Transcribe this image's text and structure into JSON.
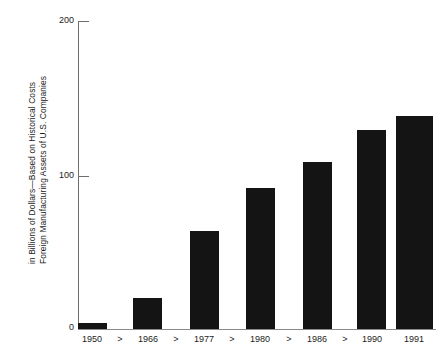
{
  "chart_data": {
    "type": "bar",
    "title": "",
    "subtitle": "",
    "xlabel": "",
    "ylabel_lines": [
      "Foreign Manufacturing Assets of U.S. Companies",
      "in Billions of Dollars—Based on Historical Costs"
    ],
    "ylabel": "Foreign Manufacturing Assets of U.S. Companies in Billions of Dollars—Based on Historical Costs",
    "categories": [
      "1950",
      "1966",
      "1977",
      "1980",
      "1986",
      "1990",
      "1991"
    ],
    "values": [
      4,
      20,
      64,
      92,
      109,
      130,
      139
    ],
    "ylim": [
      0,
      200
    ],
    "yticks": [
      "0",
      "100",
      "200"
    ],
    "ytick_values": [
      0,
      100,
      200
    ],
    "grid": false,
    "legend": "none",
    "axis_break_marker": ">",
    "axis_break_positions": [
      0,
      1,
      2,
      3,
      4
    ],
    "bar_color": "#141414",
    "axis_color": "#6e6e6e"
  },
  "xaxis": {
    "labels": [
      "1950",
      "1966",
      "1977",
      "1980",
      "1986",
      "1990",
      "1991"
    ],
    "separators": [
      ">",
      ">",
      ">",
      ">",
      ">"
    ]
  },
  "yaxis": {
    "tick_top": "200",
    "tick_mid": "100",
    "tick_bottom": "0"
  }
}
